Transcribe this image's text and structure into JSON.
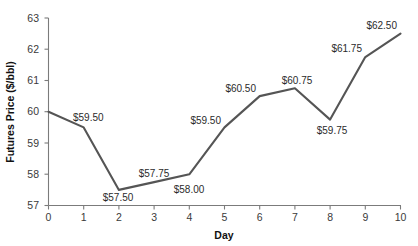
{
  "chart_data": {
    "type": "line",
    "title": "",
    "subtitle": "",
    "xlabel": "Day",
    "ylabel": "Futures Price ($/bbl)",
    "x": [
      0,
      1,
      2,
      3,
      4,
      5,
      6,
      7,
      8,
      9,
      10
    ],
    "values": [
      60.0,
      59.5,
      57.5,
      57.75,
      58.0,
      59.5,
      60.5,
      60.75,
      59.75,
      61.75,
      62.5
    ],
    "categories": [
      "0",
      "1",
      "2",
      "3",
      "4",
      "5",
      "6",
      "7",
      "8",
      "9",
      "10"
    ],
    "xlim": [
      0,
      10
    ],
    "ylim": [
      57,
      63
    ],
    "xticks": [
      "0",
      "1",
      "2",
      "3",
      "4",
      "5",
      "6",
      "7",
      "8",
      "9",
      "10"
    ],
    "yticks": [
      "57",
      "58",
      "59",
      "60",
      "61",
      "62",
      "63"
    ],
    "grid": false,
    "legend": false,
    "legend_position": "none",
    "line_color": "#555555",
    "markers": false,
    "point_labels": [
      {
        "x": 1,
        "value": 59.5,
        "text": "$59.50",
        "position": "above-right"
      },
      {
        "x": 2,
        "value": 57.5,
        "text": "$57.50",
        "position": "below"
      },
      {
        "x": 3,
        "value": 57.75,
        "text": "$57.75",
        "position": "above"
      },
      {
        "x": 4,
        "value": 58.0,
        "text": "$58.00",
        "position": "below-right"
      },
      {
        "x": 5,
        "value": 59.5,
        "text": "$59.50",
        "position": "above-left"
      },
      {
        "x": 6,
        "value": 60.5,
        "text": "$60.50",
        "position": "above-left"
      },
      {
        "x": 7,
        "value": 60.75,
        "text": "$60.75",
        "position": "above"
      },
      {
        "x": 8,
        "value": 59.75,
        "text": "$59.75",
        "position": "below"
      },
      {
        "x": 9,
        "value": 61.75,
        "text": "$61.75",
        "position": "above-left"
      },
      {
        "x": 10,
        "value": 62.5,
        "text": "$62.50",
        "position": "above-left"
      }
    ]
  },
  "axes": {
    "y_tick_0": "63",
    "y_tick_1": "62",
    "y_tick_2": "61",
    "y_tick_3": "60",
    "y_tick_4": "59",
    "y_tick_5": "58",
    "y_tick_6": "57",
    "x_tick_0": "0",
    "x_tick_1": "1",
    "x_tick_2": "2",
    "x_tick_3": "3",
    "x_tick_4": "4",
    "x_tick_5": "5",
    "x_tick_6": "6",
    "x_tick_7": "7",
    "x_tick_8": "8",
    "x_tick_9": "9",
    "x_tick_10": "10",
    "x_title": "Day",
    "y_title": "Futures Price ($/bbl)"
  },
  "labels": {
    "l1": "$59.50",
    "l2": "$57.50",
    "l3": "$57.75",
    "l4": "$58.00",
    "l5": "$59.50",
    "l6": "$60.50",
    "l7": "$60.75",
    "l8": "$59.75",
    "l9": "$61.75",
    "l10": "$62.50"
  },
  "colors": {
    "line": "#555555",
    "axis": "#7b7b7b",
    "tick_text": "#3a3a3a",
    "title_text": "#111111",
    "background": "#ffffff"
  }
}
